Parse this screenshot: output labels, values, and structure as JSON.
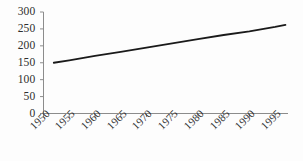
{
  "chart_data": {
    "type": "line",
    "title": "",
    "subtitle": "",
    "xlabel": "",
    "ylabel": "",
    "legend": [],
    "legend_position": "none",
    "grid": false,
    "xlim": [
      1950,
      1997.5
    ],
    "ylim": [
      0,
      300
    ],
    "ytick_labels": [
      "300",
      "250",
      "200",
      "150",
      "100",
      "50",
      "0"
    ],
    "ytick_values": [
      300,
      250,
      200,
      150,
      100,
      50,
      0
    ],
    "categories": [
      "1950",
      "1955",
      "1960",
      "1965",
      "1970",
      "1975",
      "1980",
      "1985",
      "1990",
      "1995"
    ],
    "xtick_values": [
      1950,
      1955,
      1960,
      1965,
      1970,
      1975,
      1980,
      1985,
      1990,
      1995
    ],
    "series": [
      {
        "name": "",
        "color": "#1a1a1a",
        "x": [
          1952,
          1955,
          1960,
          1965,
          1970,
          1975,
          1980,
          1985,
          1990,
          1995,
          1997
        ],
        "values": [
          150,
          157,
          170,
          182,
          195,
          207,
          220,
          232,
          243,
          256,
          262
        ]
      }
    ]
  },
  "axes": {
    "axis_color": "#8c8c8c",
    "line_color": "#1a1a1a"
  }
}
